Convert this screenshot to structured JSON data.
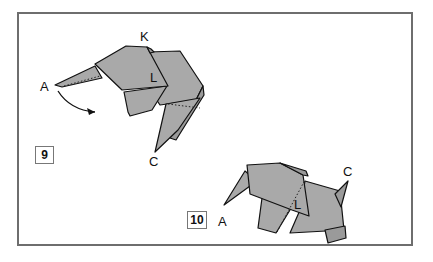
{
  "steps": [
    {
      "number": "9",
      "point_labels": {
        "a": "A",
        "k": "K",
        "l": "L",
        "c": "C"
      },
      "arrow": "curved-arrow-fold-A-down"
    },
    {
      "number": "10",
      "point_labels": {
        "a": "A",
        "l": "L",
        "c": "C"
      }
    }
  ],
  "colors": {
    "paper": "#a9a9a9",
    "outline": "#111111",
    "frame": "#6e6e6e"
  }
}
